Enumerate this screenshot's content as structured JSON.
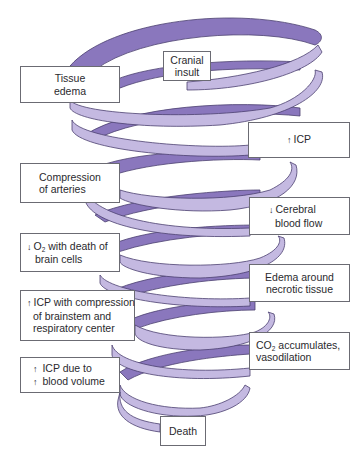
{
  "diagram": {
    "type": "spiral-flow",
    "colors": {
      "ribbon_back": "#8a77bd",
      "ribbon_front": "#c4b9e1",
      "ribbon_outline": "#4b4070",
      "box_border": "#6b6b73",
      "text": "#2a2a2e",
      "background": "#ffffff"
    },
    "nodes": [
      {
        "id": "cranial-insult",
        "lines": [
          "Cranial",
          "insult"
        ]
      },
      {
        "id": "tissue-edema",
        "lines": [
          "Tissue",
          "edema"
        ]
      },
      {
        "id": "increased-icp",
        "arrow": "↑",
        "lines": [
          "ICP"
        ]
      },
      {
        "id": "compression-of-arteries",
        "lines": [
          "Compression",
          "of arteries"
        ]
      },
      {
        "id": "decreased-cerebral-blood-flow",
        "arrow": "↓",
        "lines": [
          "Cerebral",
          "blood flow"
        ]
      },
      {
        "id": "decreased-o2",
        "arrow": "↓",
        "lines": [
          "O",
          "2",
          " with death of",
          "brain cells"
        ]
      },
      {
        "id": "edema-around-necrotic-tissue",
        "lines": [
          "Edema around",
          "necrotic tissue"
        ]
      },
      {
        "id": "icp-compression-brainstem",
        "arrow": "↑",
        "lines": [
          "ICP with compression",
          "of brainstem and",
          "respiratory center"
        ]
      },
      {
        "id": "co2-accumulates",
        "lines": [
          "CO",
          "2",
          " accumulates,",
          "vasodilation"
        ]
      },
      {
        "id": "icp-due-to-blood-volume",
        "arrow1": "↑",
        "arrow2": "↑",
        "lines": [
          "ICP due to",
          "blood volume"
        ]
      },
      {
        "id": "death",
        "lines": [
          "Death"
        ]
      }
    ]
  }
}
